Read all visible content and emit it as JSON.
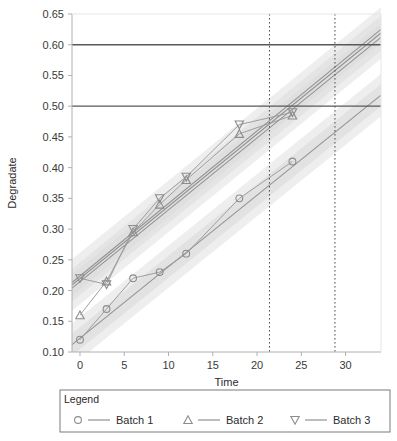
{
  "chart_data": {
    "type": "line",
    "title": "",
    "xlabel": "Time",
    "ylabel": "Degradate",
    "xlim": [
      -0.9,
      34.0
    ],
    "ylim": [
      0.1,
      0.65
    ],
    "xticks": [
      0,
      5,
      10,
      15,
      20,
      25,
      30
    ],
    "xtick_labels": [
      "0",
      "5",
      "10",
      "15",
      "20",
      "25",
      "30"
    ],
    "yticks": [
      0.1,
      0.15,
      0.2,
      0.25,
      0.3,
      0.35,
      0.4,
      0.45,
      0.5,
      0.55,
      0.6,
      0.65
    ],
    "ytick_labels": [
      "0.10",
      "0.15",
      "0.20",
      "0.25",
      "0.30",
      "0.35",
      "0.40",
      "0.45",
      "0.50",
      "0.55",
      "0.60",
      "0.65"
    ],
    "grid": false,
    "legend_position": "below",
    "legend_title": "Legend",
    "series": [
      {
        "name": "Batch 1",
        "marker": "circle",
        "x": [
          0,
          3,
          6,
          9,
          12,
          18,
          24
        ],
        "y": [
          0.12,
          0.17,
          0.22,
          0.23,
          0.26,
          0.35,
          0.41
        ]
      },
      {
        "name": "Batch 2",
        "marker": "triangle-up",
        "x": [
          0,
          3,
          6,
          9,
          12,
          18,
          24
        ],
        "y": [
          0.16,
          0.215,
          0.295,
          0.34,
          0.38,
          0.455,
          0.485
        ]
      },
      {
        "name": "Batch 3",
        "marker": "triangle-down",
        "x": [
          0,
          3,
          6,
          9,
          12,
          18,
          24
        ],
        "y": [
          0.22,
          0.21,
          0.3,
          0.35,
          0.385,
          0.47,
          0.49
        ]
      }
    ],
    "fit_lines": [
      {
        "name": "fit-batch-1",
        "x0": -0.9,
        "y0": 0.112,
        "x1": 34.0,
        "y1": 0.518
      },
      {
        "name": "fit-batch-2",
        "x0": -0.9,
        "y0": 0.204,
        "x1": 34.0,
        "y1": 0.612
      },
      {
        "name": "fit-batch-3",
        "x0": -0.9,
        "y0": 0.213,
        "x1": 34.0,
        "y1": 0.625
      },
      {
        "name": "fit-pooled-upper",
        "x0": -0.9,
        "y0": 0.209,
        "x1": 34.0,
        "y1": 0.619
      }
    ],
    "confidence_bands": [
      {
        "name": "band-batch-1",
        "half_width": 0.018
      },
      {
        "name": "band-upper-group",
        "half_width": 0.022
      }
    ],
    "reference_lines_horizontal": [
      {
        "name": "spec-limit-upper",
        "value": 0.6
      },
      {
        "name": "spec-limit-lower",
        "value": 0.5
      }
    ],
    "reference_lines_vertical": [
      {
        "name": "shelf-life-lower",
        "value": 21.4
      },
      {
        "name": "shelf-life-upper",
        "value": 28.8
      }
    ]
  },
  "legend": {
    "title": "Legend",
    "entries": [
      {
        "label": "Batch 1",
        "marker": "circle"
      },
      {
        "label": "Batch 2",
        "marker": "triangle-up"
      },
      {
        "label": "Batch 3",
        "marker": "triangle-down"
      }
    ]
  },
  "colors": {
    "marker_stroke": "#8c8c8c",
    "line": "#9a9a9a",
    "fit_line": "#8a8a8a",
    "band": "#d9d9d9",
    "reference_line": "#595959",
    "vertical_ref": "#4d4d4d",
    "axis": "#b0b0b0",
    "frame": "#c8c8c8",
    "text": "#2b2b2b"
  }
}
